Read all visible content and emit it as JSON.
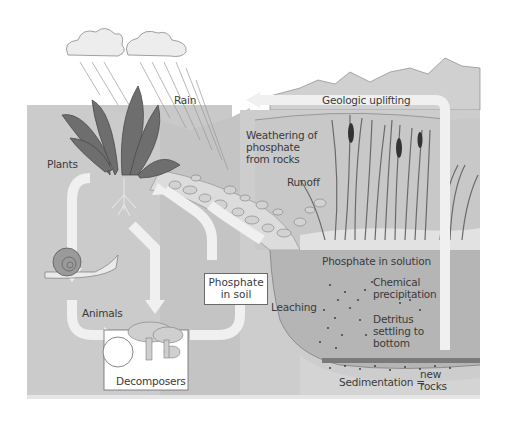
{
  "diagram": {
    "labels": {
      "rain": "Rain",
      "plants": "Plants",
      "geologic_uplifting": "Geologic uplifting",
      "weathering_1": "Weathering of",
      "weathering_2": "phosphate",
      "weathering_3": "from rocks",
      "runoff": "Runoff",
      "animals": "Animals",
      "phosphate_soil_1": "Phosphate",
      "phosphate_soil_2": "in soil",
      "leaching": "Leaching",
      "phosphate_solution": "Phosphate in solution",
      "chemical_1": "Chemical",
      "chemical_2": "precipitation",
      "detritus_1": "Detritus",
      "detritus_2": "settling to",
      "detritus_3": "bottom",
      "decomposers": "Decomposers",
      "sedimentation": "Sedimentation =",
      "new_rocks_1": "new",
      "new_rocks_2": "rocks"
    },
    "colors": {
      "ground": "#c9c9c9",
      "ground_light": "#d6d6d6",
      "water": "#b5b5b5",
      "arrow": "#f0f0f0",
      "leaf": "#6e6e6e",
      "outline": "#7a7a7a",
      "text": "#3a3a3a"
    }
  }
}
